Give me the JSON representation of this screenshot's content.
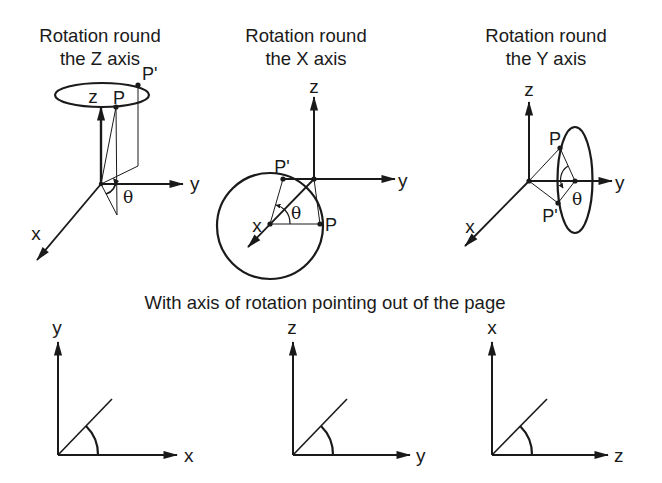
{
  "figure": {
    "panels": [
      {
        "title_line1": "Rotation round",
        "title_line2": "the Z axis",
        "axes": {
          "vertical": "z",
          "horizontal": "y",
          "diagonal": "x"
        },
        "points": {
          "p": "P",
          "p_prime": "P'"
        },
        "angle": "θ"
      },
      {
        "title_line1": "Rotation round",
        "title_line2": "the X axis",
        "axes": {
          "vertical": "z",
          "horizontal": "y",
          "diagonal": "x"
        },
        "points": {
          "p": "P",
          "p_prime": "P'"
        },
        "angle": "θ"
      },
      {
        "title_line1": "Rotation round",
        "title_line2": "the Y axis",
        "axes": {
          "vertical": "z",
          "horizontal": "y",
          "diagonal": "x"
        },
        "points": {
          "p": "P",
          "p_prime": "P'"
        },
        "angle": "θ"
      }
    ],
    "subtitle": "With axis of rotation pointing out of the page",
    "planar": [
      {
        "vertical": "y",
        "horizontal": "x"
      },
      {
        "vertical": "z",
        "horizontal": "y"
      },
      {
        "vertical": "x",
        "horizontal": "z"
      }
    ],
    "colors": {
      "ink": "#1a1a1a",
      "background": "#ffffff"
    }
  }
}
